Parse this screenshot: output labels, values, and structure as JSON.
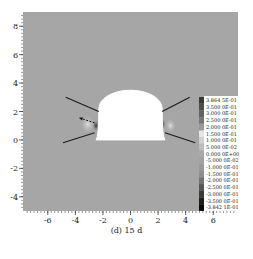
{
  "chart_data": {
    "type": "heatmap",
    "title": "",
    "caption": "(d) 15 d",
    "xlabel": "",
    "ylabel": "",
    "xlim": [
      -7.8,
      7.8
    ],
    "ylim": [
      -5.0,
      9.0
    ],
    "x_ticks": [
      -6,
      -4,
      -2,
      0,
      2,
      4,
      6
    ],
    "y_ticks": [
      -4,
      -2,
      0,
      2,
      4,
      6,
      8
    ],
    "grid": false,
    "background_value": "≈0 (uniform gray field)",
    "tunnel_opening": {
      "shape": "horseshoe",
      "crown_top_y": 3.5,
      "springline_y": 2.2,
      "invert_y": 0.0,
      "half_width_top": 2.3,
      "half_width_bottom": 2.5
    },
    "bolt_lines": [
      {
        "side": "left-upper",
        "from": [
          -2.3,
          2.0
        ],
        "to": [
          -4.7,
          3.0
        ]
      },
      {
        "side": "left-lower",
        "from": [
          -2.6,
          0.5
        ],
        "to": [
          -4.9,
          -0.2
        ]
      },
      {
        "side": "right-upper",
        "from": [
          2.3,
          2.0
        ],
        "to": [
          4.3,
          3.0
        ]
      },
      {
        "side": "right-lower",
        "from": [
          2.5,
          0.5
        ],
        "to": [
          4.7,
          -0.2
        ]
      }
    ],
    "annotations": [
      {
        "type": "arrow",
        "from": [
          -2.6,
          1.2
        ],
        "to": [
          -3.7,
          1.55
        ],
        "style": "dashed"
      }
    ],
    "legend": {
      "position": "right-inside",
      "entries": [
        "3.864 5E-01",
        "3.500 0E-01",
        "3.000 0E-01",
        "2.500 0E-01",
        "2.000 0E-01",
        "1.500 0E-01",
        "1.000 0E-01",
        "5.000 0E-02",
        "0.000 0E+00",
        "-5.000 0E-02",
        "-1.000 0E-01",
        "-1.500 0E-01",
        "-2.000 0E-01",
        "-2.500 0E-01",
        "-3.000 0E-01",
        "-3.500 0E-01",
        "-3.842 1E-01"
      ],
      "colors": [
        "#3a3a3a",
        "#4e4e4e",
        "#626262",
        "#777777",
        "#9a9a9a",
        "#e6e6e6",
        "#d0d0d0",
        "#bdbdbd",
        "#a9a9a9",
        "#a2a2a2",
        "#9a9a9a",
        "#8e8e8e",
        "#727272",
        "#555555",
        "#3a3a3a",
        "#1e1e1e",
        "#0a0a0a"
      ]
    },
    "field_color": "#a6a6a6"
  },
  "caption": "(d) 15 d"
}
